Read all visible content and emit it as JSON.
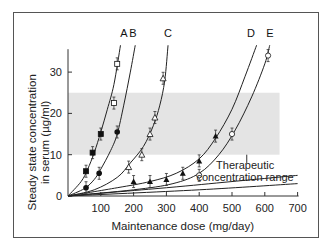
{
  "chart_data": {
    "type": "scatter",
    "title": "",
    "xlabel": "Maintenance dose (mg/day)",
    "ylabel": "Steady state concentration in serum (µg/ml)",
    "ylabel_lines": [
      "Steady state concentration",
      "in serum (µg/ml)"
    ],
    "xlim": [
      0,
      700
    ],
    "ylim": [
      0,
      37
    ],
    "x_ticks": [
      100,
      200,
      300,
      400,
      500,
      600,
      700
    ],
    "y_ticks": [
      0,
      10,
      20,
      30
    ],
    "grid": false,
    "shaded_band": {
      "label_lines": [
        "Therapeutic",
        "concentration range"
      ],
      "y_range": [
        10,
        25
      ],
      "x_range": [
        0,
        645
      ]
    },
    "series": [
      {
        "name": "A",
        "marker": "filled-square / open-square",
        "x": [
          55,
          75,
          100,
          140,
          150
        ],
        "y": [
          6,
          10.5,
          15,
          22.5,
          32
        ]
      },
      {
        "name": "B",
        "marker": "filled-circle",
        "x": [
          55,
          95,
          150
        ],
        "y": [
          2,
          5.5,
          15.5
        ]
      },
      {
        "name": "C",
        "marker": "open-triangle",
        "x": [
          185,
          225,
          250,
          265,
          290
        ],
        "y": [
          7,
          10,
          15,
          19,
          28.5
        ]
      },
      {
        "name": "D",
        "marker": "filled-triangle",
        "x": [
          200,
          250,
          300,
          350,
          400,
          450
        ],
        "y": [
          3.5,
          3.5,
          4,
          5.5,
          8.5,
          14.5
        ]
      },
      {
        "name": "E",
        "marker": "open-circle",
        "x": [
          400,
          500,
          610
        ],
        "y": [
          5,
          15,
          34
        ]
      }
    ],
    "curve_labels": [
      "A",
      "B",
      "C",
      "D",
      "E"
    ]
  }
}
